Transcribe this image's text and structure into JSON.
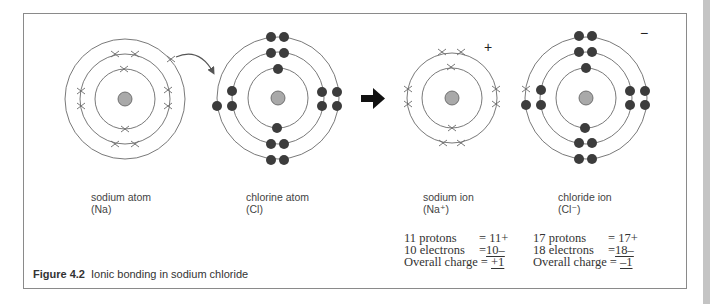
{
  "figure": {
    "number": "Figure 4.2",
    "title": "Ionic bonding in sodium chloride"
  },
  "atoms": [
    {
      "id": "sodium-atom",
      "name": "sodium atom",
      "symbol": "(Na)",
      "center": [
        125,
        99
      ],
      "shells": [
        30,
        45,
        60
      ],
      "electron_style": "cross"
    },
    {
      "id": "chlorine-atom",
      "name": "chlorine atom",
      "symbol": "(Cl)",
      "center": [
        278,
        98
      ],
      "shells": [
        30,
        46,
        61
      ],
      "electron_style": "dot"
    },
    {
      "id": "sodium-ion",
      "name": "sodium ion",
      "symbol": "(Na⁺)",
      "center": [
        452,
        98
      ],
      "shells": [
        30,
        45
      ],
      "electron_style": "cross",
      "charge_sign": "+"
    },
    {
      "id": "chloride-ion",
      "name": "chloride ion",
      "symbol": "(Cl⁻)",
      "center": [
        586,
        98
      ],
      "shells": [
        30,
        46,
        61
      ],
      "electron_style": "dot",
      "charge_sign": "−"
    }
  ],
  "charges": {
    "sodium_ion": {
      "protons_label": "11 protons",
      "protons_value": "= 11+",
      "electrons_label": "10 electrons",
      "electrons_eq": "= ",
      "electrons_value": "10–",
      "overall_label": "Overall charge",
      "overall_eq": " = ",
      "overall_value": "+1"
    },
    "chloride_ion": {
      "protons_label": "17 protons",
      "protons_value": "= 17+",
      "electrons_label": "18 electrons",
      "electrons_eq": "= ",
      "electrons_value": "18–",
      "overall_label": "Overall charge",
      "overall_eq": " = ",
      "overall_value": "–1"
    }
  },
  "transfer_arrow": "electron transfer arrow",
  "reaction_arrow": "right arrow",
  "colors": {
    "shell": "#6a6a6a",
    "nucleus_fill": "#a9a9a9",
    "nucleus_stroke": "#5a5a5a",
    "electron_dot": "#3c3c3c",
    "cross": "#6a6a6a",
    "frame": "#8a8a8a"
  }
}
